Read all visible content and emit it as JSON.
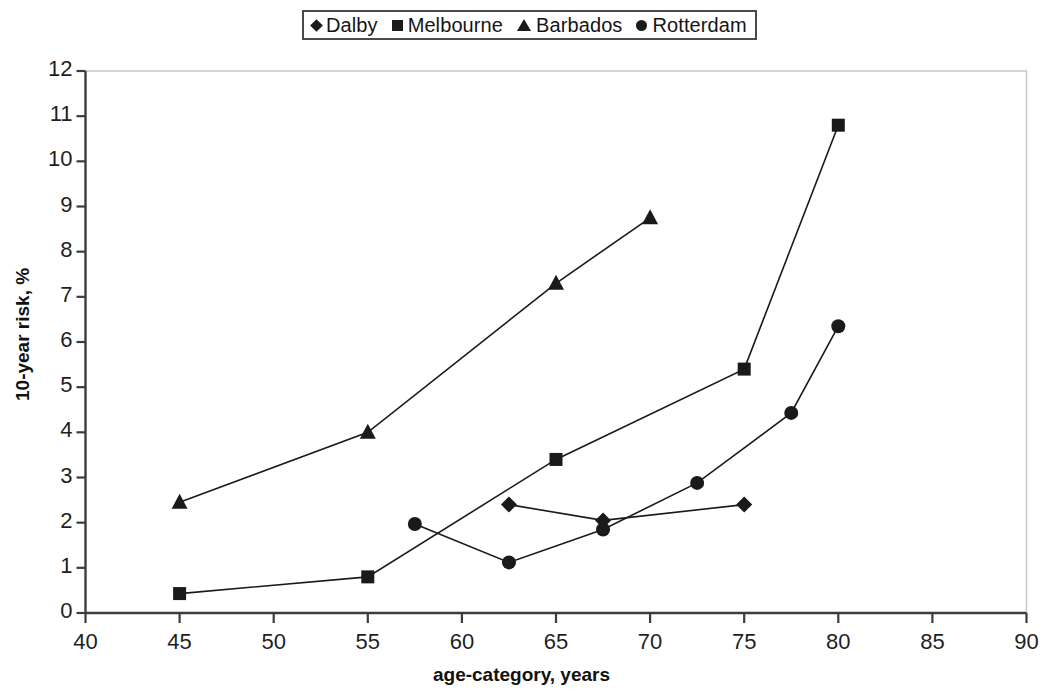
{
  "chart_data": {
    "type": "line",
    "title": "",
    "xlabel": "age-category, years",
    "ylabel": "10-year risk, %",
    "xlim": [
      40,
      90
    ],
    "ylim": [
      0,
      12
    ],
    "xticks": [
      40,
      45,
      50,
      55,
      60,
      65,
      70,
      75,
      80,
      85,
      90
    ],
    "yticks": [
      0,
      1,
      2,
      3,
      4,
      5,
      6,
      7,
      8,
      9,
      10,
      11,
      12
    ],
    "grid": false,
    "legend_position": "top-center",
    "series": [
      {
        "name": "Dalby",
        "marker": "diamond",
        "x": [
          62.5,
          67.5,
          75
        ],
        "y": [
          2.4,
          2.05,
          2.4
        ]
      },
      {
        "name": "Melbourne",
        "marker": "square",
        "x": [
          45,
          55,
          65,
          75,
          80
        ],
        "y": [
          0.43,
          0.8,
          3.4,
          5.4,
          10.8
        ]
      },
      {
        "name": "Barbados",
        "marker": "triangle",
        "x": [
          45,
          55,
          65,
          70
        ],
        "y": [
          2.45,
          4.0,
          7.3,
          8.75
        ]
      },
      {
        "name": "Rotterdam",
        "marker": "circle",
        "x": [
          57.5,
          62.5,
          67.5,
          72.5,
          77.5,
          80
        ],
        "y": [
          1.97,
          1.12,
          1.85,
          2.88,
          4.43,
          6.35
        ]
      }
    ]
  },
  "legend": {
    "entries": [
      {
        "label": "Dalby",
        "marker": "diamond-marker-icon"
      },
      {
        "label": "Melbourne",
        "marker": "square-marker-icon"
      },
      {
        "label": "Barbados",
        "marker": "triangle-marker-icon"
      },
      {
        "label": "Rotterdam",
        "marker": "circle-marker-icon"
      }
    ]
  },
  "axes": {
    "y_title": "10-year risk, %",
    "x_title": "age-category, years",
    "y_tick_labels": [
      "12",
      "11",
      "10",
      "9",
      "8",
      "7",
      "6",
      "5",
      "4",
      "3",
      "2",
      "1",
      "0"
    ],
    "x_tick_labels": [
      "40",
      "45",
      "50",
      "55",
      "60",
      "65",
      "70",
      "75",
      "80",
      "85",
      "90"
    ]
  },
  "colors": {
    "series": "#1a1a1a",
    "axis": "#3c3c3c",
    "plot_border": "#c9c9c9",
    "background": "#ffffff",
    "text": "#151515"
  }
}
